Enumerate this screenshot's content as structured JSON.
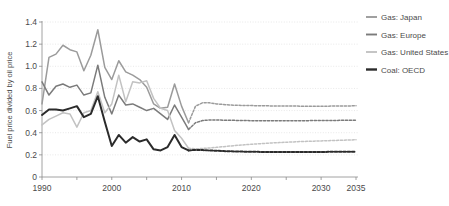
{
  "chart_data": {
    "type": "line",
    "title": "",
    "xlabel": "",
    "ylabel": "Fuel price divided by oil price",
    "xlim": [
      1990,
      2035
    ],
    "ylim": [
      0,
      1.4
    ],
    "ytick_step": 0.2,
    "yticks": [
      "0",
      "0.2",
      "0.4",
      "0.6",
      "0.8",
      "1.0",
      "1.2",
      "1.4"
    ],
    "xticks_major": [
      "1990",
      "2000",
      "2010",
      "2020",
      "2030",
      "2035"
    ],
    "xticks_major_values": [
      1990,
      2000,
      2010,
      2020,
      2030,
      2035
    ],
    "xticks_minor_values": [
      1995,
      2005,
      2015,
      2025
    ],
    "grid": "horizontal-dotted",
    "legend_position": "right",
    "projection_starts": 2011,
    "series": [
      {
        "name": "Gas: Japan",
        "color": "#9b9b9b",
        "width": 1.5,
        "x": [
          1990,
          1991,
          1992,
          1993,
          1994,
          1995,
          1996,
          1997,
          1998,
          1999,
          2000,
          2001,
          2002,
          2003,
          2004,
          2005,
          2006,
          2007,
          2008,
          2009,
          2010,
          2011
        ],
        "values": [
          0.66,
          1.08,
          1.11,
          1.19,
          1.15,
          1.13,
          0.96,
          1.1,
          1.33,
          0.99,
          0.88,
          1.05,
          0.95,
          0.92,
          0.88,
          0.81,
          0.66,
          0.62,
          0.63,
          0.84,
          0.64,
          0.49
        ],
        "x_projection": [
          2011,
          2012,
          2013,
          2014,
          2015,
          2016,
          2017,
          2018,
          2019,
          2020,
          2021,
          2022,
          2023,
          2024,
          2025,
          2026,
          2027,
          2028,
          2029,
          2030,
          2031,
          2032,
          2033,
          2034,
          2035
        ],
        "projection": [
          0.49,
          0.64,
          0.67,
          0.67,
          0.66,
          0.655,
          0.65,
          0.648,
          0.646,
          0.645,
          0.644,
          0.643,
          0.642,
          0.642,
          0.641,
          0.641,
          0.64,
          0.64,
          0.64,
          0.64,
          0.64,
          0.641,
          0.641,
          0.642,
          0.643
        ]
      },
      {
        "name": "Gas: Europe",
        "color": "#7b7b7b",
        "width": 1.5,
        "x": [
          1990,
          1991,
          1992,
          1993,
          1994,
          1995,
          1996,
          1997,
          1998,
          1999,
          2000,
          2001,
          2002,
          2003,
          2004,
          2005,
          2006,
          2007,
          2008,
          2009,
          2010,
          2011
        ],
        "values": [
          0.86,
          0.74,
          0.82,
          0.84,
          0.81,
          0.83,
          0.74,
          0.76,
          1.01,
          0.72,
          0.57,
          0.74,
          0.65,
          0.66,
          0.63,
          0.6,
          0.62,
          0.57,
          0.52,
          0.65,
          0.54,
          0.43
        ],
        "x_projection": [
          2011,
          2012,
          2013,
          2014,
          2015,
          2016,
          2017,
          2018,
          2019,
          2020,
          2021,
          2022,
          2023,
          2024,
          2025,
          2026,
          2027,
          2028,
          2029,
          2030,
          2031,
          2032,
          2033,
          2034,
          2035
        ],
        "projection": [
          0.43,
          0.49,
          0.51,
          0.515,
          0.515,
          0.513,
          0.512,
          0.511,
          0.51,
          0.509,
          0.509,
          0.508,
          0.508,
          0.508,
          0.508,
          0.508,
          0.509,
          0.509,
          0.51,
          0.51,
          0.511,
          0.511,
          0.512,
          0.512,
          0.513
        ]
      },
      {
        "name": "Gas: United States",
        "color": "#c2c2c2",
        "width": 1.5,
        "x": [
          1990,
          1991,
          1992,
          1993,
          1994,
          1995,
          1996,
          1997,
          1998,
          1999,
          2000,
          2001,
          2002,
          2003,
          2004,
          2005,
          2006,
          2007,
          2008,
          2009,
          2010,
          2011
        ],
        "values": [
          0.47,
          0.52,
          0.55,
          0.58,
          0.57,
          0.45,
          0.58,
          0.6,
          0.77,
          0.58,
          0.66,
          0.92,
          0.68,
          0.86,
          0.85,
          0.87,
          0.71,
          0.62,
          0.6,
          0.42,
          0.35,
          0.26
        ],
        "x_projection": [
          2011,
          2012,
          2013,
          2014,
          2015,
          2016,
          2017,
          2018,
          2019,
          2020,
          2021,
          2022,
          2023,
          2024,
          2025,
          2026,
          2027,
          2028,
          2029,
          2030,
          2031,
          2032,
          2033,
          2034,
          2035
        ],
        "projection": [
          0.26,
          0.255,
          0.258,
          0.262,
          0.268,
          0.274,
          0.28,
          0.286,
          0.291,
          0.296,
          0.3,
          0.304,
          0.308,
          0.311,
          0.314,
          0.317,
          0.32,
          0.322,
          0.324,
          0.326,
          0.328,
          0.33,
          0.332,
          0.334,
          0.336
        ]
      },
      {
        "name": "Coal: OECD",
        "color": "#2b2b2b",
        "width": 2.0,
        "x": [
          1990,
          1991,
          1992,
          1993,
          1994,
          1995,
          1996,
          1997,
          1998,
          1999,
          2000,
          2001,
          2002,
          2003,
          2004,
          2005,
          2006,
          2007,
          2008,
          2009,
          2010,
          2011
        ],
        "values": [
          0.56,
          0.61,
          0.61,
          0.6,
          0.62,
          0.64,
          0.54,
          0.57,
          0.73,
          0.5,
          0.28,
          0.38,
          0.31,
          0.36,
          0.32,
          0.34,
          0.25,
          0.24,
          0.27,
          0.38,
          0.27,
          0.24
        ],
        "x_projection": [
          2011,
          2012,
          2013,
          2014,
          2015,
          2016,
          2017,
          2018,
          2019,
          2020,
          2021,
          2022,
          2023,
          2024,
          2025,
          2026,
          2027,
          2028,
          2029,
          2030,
          2031,
          2032,
          2033,
          2034,
          2035
        ],
        "projection": [
          0.24,
          0.245,
          0.243,
          0.24,
          0.237,
          0.234,
          0.232,
          0.23,
          0.229,
          0.228,
          0.227,
          0.226,
          0.226,
          0.225,
          0.225,
          0.225,
          0.225,
          0.225,
          0.226,
          0.226,
          0.227,
          0.227,
          0.228,
          0.228,
          0.229
        ]
      }
    ]
  },
  "legend": {
    "items": [
      {
        "label": "Gas: Japan"
      },
      {
        "label": "Gas: Europe"
      },
      {
        "label": "Gas: United States"
      },
      {
        "label": "Coal: OECD"
      }
    ]
  }
}
